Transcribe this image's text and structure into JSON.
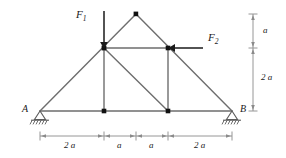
{
  "figure": {
    "type": "truss-free-body-diagram",
    "colors": {
      "member": "#6e6e6e",
      "force": "#1a1a1a",
      "dimension": "#8a8a8a",
      "node": "#111111",
      "text": "#1a1a1a",
      "background": "#ffffff"
    }
  },
  "forces": [
    {
      "id": "F1",
      "label": "F",
      "subscript": "1",
      "direction": "down",
      "applied_at": "left-upper-node"
    },
    {
      "id": "F2",
      "label": "F",
      "subscript": "2",
      "direction": "left",
      "applied_at": "right-upper-node"
    }
  ],
  "supports": [
    {
      "id": "A",
      "label": "A",
      "kind": "pinned",
      "position": "bottom-left"
    },
    {
      "id": "B",
      "label": "B",
      "kind": "pinned",
      "position": "bottom-right"
    }
  ],
  "dimensions": {
    "horizontal": [
      {
        "value": "2 a",
        "num": "2",
        "unit": "a"
      },
      {
        "value": "a",
        "num": "",
        "unit": "a"
      },
      {
        "value": "a",
        "num": "",
        "unit": "a"
      },
      {
        "value": "2 a",
        "num": "2",
        "unit": "a"
      }
    ],
    "vertical": [
      {
        "value": "a",
        "num": "",
        "unit": "a"
      },
      {
        "value": "2 a",
        "num": "2",
        "unit": "a"
      }
    ]
  },
  "geometry": {
    "nodes": {
      "support_a": [
        40,
        111
      ],
      "support_b": [
        232,
        111
      ],
      "apex": [
        136,
        14
      ],
      "left_upper": [
        104,
        48
      ],
      "right_upper": [
        168,
        48
      ],
      "left_lower": [
        104,
        111
      ],
      "right_lower": [
        168,
        111
      ]
    }
  }
}
